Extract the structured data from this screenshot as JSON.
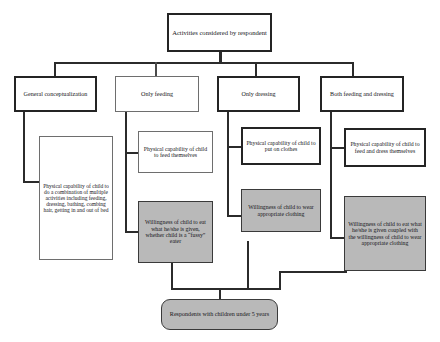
{
  "diagram": {
    "type": "flowchart",
    "title_node": {
      "id": "activities-considered",
      "label": "Activities considered by respondent"
    },
    "categories": [
      {
        "id": "general-conceptualization",
        "label": "General conceptualization"
      },
      {
        "id": "only-feeding",
        "label": "Only feeding"
      },
      {
        "id": "only-dressing",
        "label": "Only dressing"
      },
      {
        "id": "both-feeding-and-dressing",
        "label": "Both feeding and dressing"
      }
    ],
    "capability_nodes": [
      {
        "id": "capability-general",
        "label": "Physical capability of child to do a combination of multiple activities including feeding, dressing, bathing, combing hair, getting in and out of bed"
      },
      {
        "id": "capability-feeding",
        "label": "Physical capability of child to feed themselves"
      },
      {
        "id": "capability-dressing",
        "label": "Physical capability of child to put on clothes"
      },
      {
        "id": "capability-both",
        "label": "Physical capability of child to feed and dress themselves"
      }
    ],
    "willingness_nodes": [
      {
        "id": "willingness-feeding",
        "label": "Willingness of child to eat what he/she is given, whether child is a “fussy” eater"
      },
      {
        "id": "willingness-dressing",
        "label": "Willingness of child to wear appropriate clothing"
      },
      {
        "id": "willingness-both",
        "label": "Willingness of child to eat what he/she is given coupled with the willingness of child to wear appropriate clothing"
      }
    ],
    "outcome_node": {
      "id": "respondents-with-children",
      "label": "Respondents with children under 5 years"
    },
    "colors": {
      "shaded_fill": "#b9b9b9",
      "plain_fill": "#ffffff",
      "border": "#3a3a3a",
      "connector": "#2b2b2b",
      "text": "#16161a"
    }
  }
}
